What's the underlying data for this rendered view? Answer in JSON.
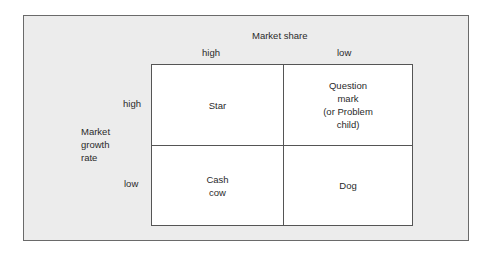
{
  "axes": {
    "x_title": "Market share",
    "x_high": "high",
    "x_low": "low",
    "y_title": "Market\ngrowth\nrate",
    "y_high": "high",
    "y_low": "low"
  },
  "quadrants": {
    "top_left": "Star",
    "top_right": "Question\nmark\n(or Problem\nchild)",
    "bottom_left": "Cash\ncow",
    "bottom_right": "Dog"
  }
}
